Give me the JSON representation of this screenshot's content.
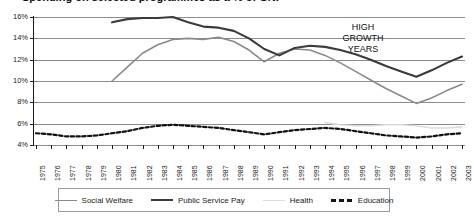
{
  "title": "Spending on selected programmes as a % of GNP",
  "annotation": {
    "line1": "HIGH",
    "line2": "GROWTH",
    "line3": "YEARS"
  },
  "axis": {
    "y_labels": [
      "16%",
      "14%",
      "12%",
      "10%",
      "8%",
      "6%",
      "4%"
    ],
    "x_labels": [
      "1975",
      "1976",
      "1977",
      "1978",
      "1979",
      "1980",
      "1981",
      "1982",
      "1983",
      "1984",
      "1985",
      "1986",
      "1987",
      "1988",
      "1989",
      "1990",
      "1991",
      "1992",
      "1993",
      "1994",
      "1995",
      "1996",
      "1997",
      "1998",
      "1999",
      "2000",
      "2001",
      "2002",
      "2003"
    ]
  },
  "legend": {
    "items": [
      {
        "label": "Social Welfare",
        "color": "#8a8a8a",
        "style": "solid"
      },
      {
        "label": "Public Service Pay",
        "color": "#3b3b3b",
        "style": "solid-thick"
      },
      {
        "label": "Health",
        "color": "#dcdcdc",
        "style": "solid-light"
      },
      {
        "label": "Education",
        "color": "#111111",
        "style": "dashed"
      }
    ]
  },
  "chart_data": {
    "type": "line",
    "title": "Spending on selected programmes as a % of GNP",
    "xlabel": "",
    "ylabel": "% of GNP",
    "ylim": [
      4,
      16
    ],
    "ytick_step": 2,
    "grid": true,
    "legend_position": "bottom",
    "annotations": [
      {
        "text": "HIGH GROWTH YEARS",
        "x": 1996.5,
        "y": 15.0
      }
    ],
    "x": [
      1975,
      1976,
      1977,
      1978,
      1979,
      1980,
      1981,
      1982,
      1983,
      1984,
      1985,
      1986,
      1987,
      1988,
      1989,
      1990,
      1991,
      1992,
      1993,
      1994,
      1995,
      1996,
      1997,
      1998,
      1999,
      2000,
      2001,
      2002,
      2003
    ],
    "series": [
      {
        "name": "Social Welfare",
        "color": "#8a8a8a",
        "x": [
          1980,
          1981,
          1982,
          1983,
          1984,
          1985,
          1986,
          1987,
          1988,
          1989,
          1990,
          1991,
          1992,
          1993,
          1994,
          1995,
          1996,
          1997,
          1998,
          1999,
          2000,
          2001,
          2002,
          2003
        ],
        "values": [
          10.0,
          11.3,
          12.6,
          13.4,
          13.9,
          14.0,
          13.9,
          14.1,
          13.7,
          12.9,
          11.8,
          12.6,
          13.0,
          12.9,
          12.4,
          11.7,
          10.9,
          10.1,
          9.3,
          8.6,
          7.9,
          8.4,
          9.1,
          9.7
        ]
      },
      {
        "name": "Public Service Pay",
        "color": "#3b3b3b",
        "x": [
          1980,
          1981,
          1982,
          1983,
          1984,
          1985,
          1986,
          1987,
          1988,
          1989,
          1990,
          1991,
          1992,
          1993,
          1994,
          1995,
          1996,
          1997,
          1998,
          1999,
          2000,
          2001,
          2002,
          2003
        ],
        "values": [
          15.5,
          15.8,
          15.9,
          15.9,
          16.0,
          15.5,
          15.1,
          15.0,
          14.7,
          14.0,
          13.0,
          12.4,
          13.1,
          13.3,
          13.2,
          12.9,
          12.5,
          12.0,
          11.4,
          10.9,
          10.4,
          11.0,
          11.7,
          12.3
        ]
      },
      {
        "name": "Health",
        "color": "#dcdcdc",
        "x": [
          1994,
          1995,
          1996,
          1997,
          1998,
          1999,
          2000,
          2001,
          2002,
          2003
        ],
        "values": [
          6.1,
          5.9,
          5.8,
          5.8,
          5.9,
          5.9,
          5.8,
          5.6,
          5.6,
          5.7
        ]
      },
      {
        "name": "Education",
        "color": "#111111",
        "x": [
          1975,
          1976,
          1977,
          1978,
          1979,
          1980,
          1981,
          1982,
          1983,
          1984,
          1985,
          1986,
          1987,
          1988,
          1989,
          1990,
          1991,
          1992,
          1993,
          1994,
          1995,
          1996,
          1997,
          1998,
          1999,
          2000,
          2001,
          2002,
          2003
        ],
        "values": [
          5.1,
          5.0,
          4.8,
          4.8,
          4.9,
          5.1,
          5.3,
          5.6,
          5.8,
          5.9,
          5.8,
          5.7,
          5.6,
          5.4,
          5.2,
          5.0,
          5.2,
          5.4,
          5.5,
          5.6,
          5.5,
          5.3,
          5.1,
          4.9,
          4.8,
          4.7,
          4.8,
          5.0,
          5.1
        ]
      }
    ]
  }
}
